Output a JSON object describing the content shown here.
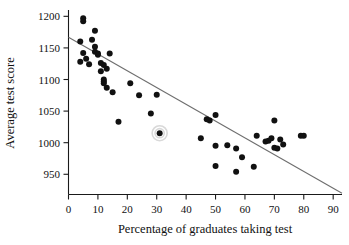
{
  "chart_data": {
    "type": "scatter",
    "title": "",
    "xlabel": "Percentage of graduates taking test",
    "ylabel": "Average test score",
    "xlim": [
      0,
      93
    ],
    "ylim": [
      918,
      1210
    ],
    "xticks": [
      0,
      10,
      20,
      30,
      40,
      50,
      60,
      70,
      80,
      90
    ],
    "yticks": [
      950,
      1000,
      1050,
      1100,
      1150,
      1200
    ],
    "grid": false,
    "legend": null,
    "series": [
      {
        "name": "States",
        "marker": "filled-circle",
        "color": "#111111",
        "points": [
          [
            5,
            1192
          ],
          [
            5,
            1197
          ],
          [
            4,
            1160
          ],
          [
            4,
            1128
          ],
          [
            5,
            1142
          ],
          [
            9,
            1177
          ],
          [
            8,
            1163
          ],
          [
            9,
            1152
          ],
          [
            9,
            1144
          ],
          [
            10,
            1141
          ],
          [
            6,
            1133
          ],
          [
            7,
            1124
          ],
          [
            10,
            1139
          ],
          [
            11,
            1126
          ],
          [
            12,
            1123
          ],
          [
            11,
            1113
          ],
          [
            12,
            1100
          ],
          [
            12,
            1097
          ],
          [
            12,
            1094
          ],
          [
            13,
            1117
          ],
          [
            14,
            1141
          ],
          [
            13,
            1087
          ],
          [
            15,
            1080
          ],
          [
            17,
            1033
          ],
          [
            21,
            1094
          ],
          [
            24,
            1075
          ],
          [
            28,
            1046
          ],
          [
            30,
            1076
          ],
          [
            31,
            1015
          ],
          [
            45,
            1007
          ],
          [
            47,
            1037
          ],
          [
            48,
            1035
          ],
          [
            50,
            1044
          ],
          [
            50,
            995
          ],
          [
            50,
            963
          ],
          [
            54,
            996
          ],
          [
            57,
            991
          ],
          [
            57,
            954
          ],
          [
            59,
            977
          ],
          [
            63,
            962
          ],
          [
            64,
            1011
          ],
          [
            67,
            1002
          ],
          [
            68,
            1003
          ],
          [
            69,
            1007
          ],
          [
            70,
            1035
          ],
          [
            70,
            992
          ],
          [
            71,
            991
          ],
          [
            72,
            1005
          ],
          [
            73,
            997
          ],
          [
            79,
            1011
          ],
          [
            80,
            1011
          ]
        ]
      }
    ],
    "highlighted_point": {
      "x": 31,
      "y": 1015,
      "annotation_style": "circle-outline",
      "color": "#d9d9d9"
    },
    "trendline": {
      "type": "linear",
      "color": "#6e6e6e",
      "x_start": 0,
      "y_start": 1167,
      "x_end": 93,
      "y_end": 920
    }
  }
}
